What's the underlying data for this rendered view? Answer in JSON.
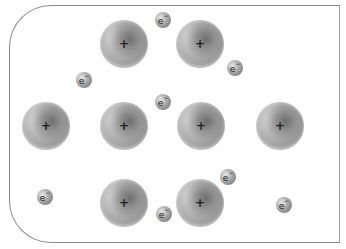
{
  "diagram": {
    "container": {
      "shape": "rounded-rectangle-left-corners",
      "border_color": "#8a8a8a"
    },
    "ion_symbol": "+",
    "electron_symbol": "e",
    "electron_charge": "−",
    "colors": {
      "ion": "#a5a5a5",
      "electron": "#9a9a9a",
      "border": "#8a8a8a"
    },
    "ions": [
      {
        "id": "ion-1",
        "x": 124,
        "y": 44,
        "label": "+"
      },
      {
        "id": "ion-2",
        "x": 200,
        "y": 44,
        "label": "+"
      },
      {
        "id": "ion-3",
        "x": 46,
        "y": 126,
        "label": "+"
      },
      {
        "id": "ion-4",
        "x": 124,
        "y": 126,
        "label": "+"
      },
      {
        "id": "ion-5",
        "x": 201,
        "y": 126,
        "label": "+"
      },
      {
        "id": "ion-6",
        "x": 280,
        "y": 126,
        "label": "+"
      },
      {
        "id": "ion-7",
        "x": 124,
        "y": 203,
        "label": "+"
      },
      {
        "id": "ion-8",
        "x": 200,
        "y": 203,
        "label": "+"
      }
    ],
    "electrons": [
      {
        "id": "electron-1",
        "x": 163,
        "y": 20,
        "label": "e",
        "charge": "−"
      },
      {
        "id": "electron-2",
        "x": 235,
        "y": 68,
        "label": "e",
        "charge": "−"
      },
      {
        "id": "electron-3",
        "x": 84,
        "y": 80,
        "label": "e",
        "charge": "−"
      },
      {
        "id": "electron-4",
        "x": 163,
        "y": 102,
        "label": "e",
        "charge": "−"
      },
      {
        "id": "electron-5",
        "x": 228,
        "y": 177,
        "label": "e",
        "charge": "−"
      },
      {
        "id": "electron-6",
        "x": 45,
        "y": 197,
        "label": "e",
        "charge": "−"
      },
      {
        "id": "electron-7",
        "x": 164,
        "y": 214,
        "label": "e",
        "charge": "−"
      },
      {
        "id": "electron-8",
        "x": 284,
        "y": 205,
        "label": "e",
        "charge": "−"
      }
    ]
  }
}
